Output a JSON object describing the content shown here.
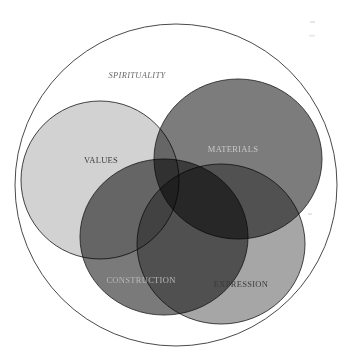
{
  "diagram": {
    "type": "venn",
    "outer": {
      "label": "SPIRITUALITY",
      "cx": 176,
      "cy": 185,
      "r": 161,
      "label_x": 137,
      "label_y": 78,
      "label_color": "#6a6a6a"
    },
    "sets": [
      {
        "label": "VALUES",
        "cx": 100,
        "cy": 180,
        "rx": 79,
        "ry": 79,
        "fill": "#d2d2d2",
        "label_x": 101,
        "label_y": 163,
        "label_color": "#3e3e3e"
      },
      {
        "label": "MATERIALS",
        "cx": 238,
        "cy": 159,
        "rx": 84,
        "ry": 80,
        "fill": "#7c7c7c",
        "label_x": 233,
        "label_y": 152,
        "label_color": "#c8c8c8"
      },
      {
        "label": "CONSTRUCTION",
        "cx": 164,
        "cy": 237,
        "rx": 84,
        "ry": 78,
        "fill": "#7a7a7a",
        "label_x": 141,
        "label_y": 283,
        "label_color": "#b8b8b8"
      },
      {
        "label": "EXPRESSION",
        "cx": 221,
        "cy": 244,
        "rx": 84,
        "ry": 80,
        "fill": "#a6a6a6",
        "label_x": 241,
        "label_y": 287,
        "label_color": "#3a3a3a"
      }
    ]
  }
}
